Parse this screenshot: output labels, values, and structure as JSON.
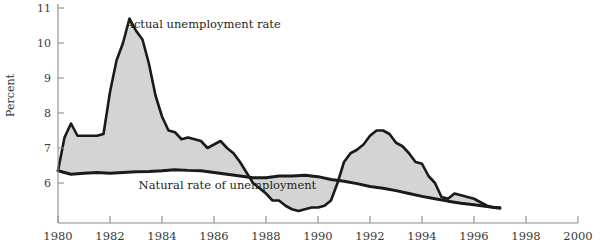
{
  "chart_data": {
    "type": "area",
    "title": "",
    "xlabel": "",
    "ylabel": "Percent",
    "xlim": [
      1980,
      2000
    ],
    "ylim": [
      5.0,
      11.3
    ],
    "grid": false,
    "legend_position": "inline-annotations",
    "xticks": [
      "1980",
      "1982",
      "1984",
      "1986",
      "1988",
      "1990",
      "1992",
      "1994",
      "1996",
      "1998",
      "2000"
    ],
    "yticks": [
      "6",
      "7",
      "8",
      "9",
      "10",
      "11"
    ],
    "fill_color": "#d4d4d4",
    "line_color": "#1a1a1a",
    "annotations": [
      {
        "text": "Actual unemployment rate",
        "x": 1982.6,
        "y": 10.55
      },
      {
        "text": "Natural rate of unemployment",
        "x": 1983.1,
        "y": 5.95
      }
    ],
    "series": [
      {
        "name": "Actual unemployment rate",
        "x": [
          1980.0,
          1980.25,
          1980.5,
          1980.75,
          1981.0,
          1981.25,
          1981.5,
          1981.75,
          1982.0,
          1982.25,
          1982.5,
          1982.75,
          1983.0,
          1983.25,
          1983.5,
          1983.75,
          1984.0,
          1984.25,
          1984.5,
          1984.75,
          1985.0,
          1985.25,
          1985.5,
          1985.75,
          1986.0,
          1986.25,
          1986.5,
          1986.75,
          1987.0,
          1987.25,
          1987.5,
          1987.75,
          1988.0,
          1988.25,
          1988.5,
          1988.75,
          1989.0,
          1989.25,
          1989.5,
          1989.75,
          1990.0,
          1990.25,
          1990.5,
          1990.75,
          1991.0,
          1991.25,
          1991.5,
          1991.75,
          1992.0,
          1992.25,
          1992.5,
          1992.75,
          1993.0,
          1993.25,
          1993.5,
          1993.75,
          1994.0,
          1994.25,
          1994.5,
          1994.75,
          1995.0,
          1995.25,
          1995.5,
          1995.75,
          1996.0,
          1996.25,
          1996.5,
          1996.75,
          1997.0
        ],
        "values": [
          6.35,
          7.3,
          7.7,
          7.35,
          7.35,
          7.35,
          7.35,
          7.4,
          8.6,
          9.5,
          10.0,
          10.7,
          10.35,
          10.1,
          9.4,
          8.5,
          7.9,
          7.5,
          7.45,
          7.25,
          7.3,
          7.25,
          7.2,
          7.0,
          7.1,
          7.2,
          7.0,
          6.85,
          6.6,
          6.3,
          6.0,
          5.85,
          5.7,
          5.5,
          5.5,
          5.35,
          5.25,
          5.2,
          5.25,
          5.3,
          5.3,
          5.35,
          5.5,
          6.0,
          6.6,
          6.85,
          6.95,
          7.1,
          7.35,
          7.5,
          7.5,
          7.4,
          7.15,
          7.05,
          6.85,
          6.6,
          6.55,
          6.2,
          6.0,
          5.6,
          5.55,
          5.7,
          5.65,
          5.6,
          5.55,
          5.45,
          5.35,
          5.3,
          5.3
        ]
      },
      {
        "name": "Natural rate of unemployment",
        "x": [
          1980.0,
          1980.5,
          1981.0,
          1981.5,
          1982.0,
          1982.5,
          1983.0,
          1983.5,
          1984.0,
          1984.5,
          1985.0,
          1985.5,
          1986.0,
          1986.5,
          1987.0,
          1987.5,
          1988.0,
          1988.5,
          1989.0,
          1989.5,
          1990.0,
          1990.5,
          1991.0,
          1991.5,
          1992.0,
          1992.5,
          1993.0,
          1993.5,
          1994.0,
          1994.5,
          1995.0,
          1995.5,
          1996.0,
          1996.5,
          1997.0
        ],
        "values": [
          6.35,
          6.25,
          6.28,
          6.3,
          6.28,
          6.3,
          6.32,
          6.33,
          6.35,
          6.38,
          6.36,
          6.35,
          6.3,
          6.25,
          6.2,
          6.15,
          6.15,
          6.2,
          6.2,
          6.22,
          6.18,
          6.1,
          6.05,
          5.98,
          5.9,
          5.85,
          5.78,
          5.7,
          5.62,
          5.55,
          5.48,
          5.42,
          5.38,
          5.33,
          5.28
        ]
      }
    ]
  }
}
